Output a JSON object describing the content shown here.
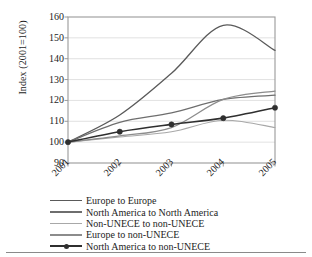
{
  "chart_data": {
    "type": "line",
    "title": "",
    "subtitle": "",
    "xlabel": "",
    "ylabel": "Index (2001=100)",
    "x": [
      "2001",
      "2002",
      "2003",
      "2004",
      "2005"
    ],
    "categories": [
      "2001",
      "2002",
      "2003",
      "2004",
      "2005"
    ],
    "xlim": [
      2001,
      2005
    ],
    "ylim": [
      90,
      160
    ],
    "yticks": [
      "90",
      "100",
      "110",
      "120",
      "130",
      "140",
      "150",
      "160"
    ],
    "ytick_values": [
      90,
      100,
      110,
      120,
      130,
      140,
      150,
      160
    ],
    "grid": "horizontal",
    "legend_position": "below",
    "series": [
      {
        "name": "Europe to Europe",
        "values": [
          100,
          113,
          133,
          156,
          144
        ],
        "color": "#5a5a5a",
        "width": 1.3,
        "marker": "none"
      },
      {
        "name": "North America to North America",
        "values": [
          100,
          109.5,
          114,
          120.5,
          122.5
        ],
        "color": "#6e6e6e",
        "width": 1.3,
        "marker": "none"
      },
      {
        "name": "Non-UNECE to non-UNECE",
        "values": [
          100,
          102.5,
          105,
          110.5,
          107
        ],
        "color": "#a8a8a8",
        "width": 1.1,
        "marker": "none"
      },
      {
        "name": "Europe to non-UNECE",
        "values": [
          100,
          103,
          107,
          120.5,
          124.5
        ],
        "color": "#8c8c8c",
        "width": 1.3,
        "marker": "none"
      },
      {
        "name": "North America to non-UNECE",
        "values": [
          100,
          105,
          108.5,
          111.5,
          116.5
        ],
        "color": "#2f2f2f",
        "width": 1.6,
        "marker": "circle"
      }
    ]
  },
  "axes": {
    "frame_color": "#9a9a9a",
    "gridline_color": "#d9d9d9",
    "tick_color": "#9a9a9a"
  }
}
